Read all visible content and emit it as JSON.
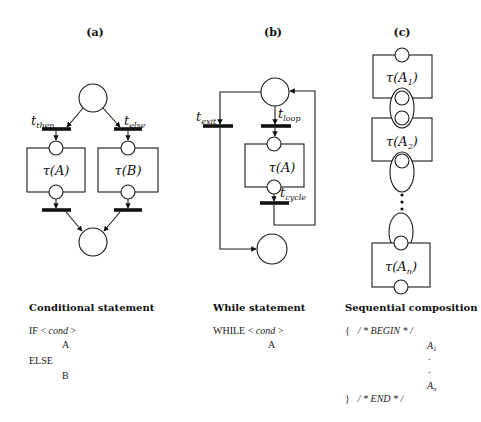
{
  "panels": {
    "a": {
      "label": "(a)",
      "transition_then": "then",
      "transition_else": "else",
      "box_a": "A",
      "box_b": "B",
      "title": "Conditional statement",
      "code": {
        "if_kw": "IF",
        "cond": "cond",
        "body_then": "A",
        "else_kw": "ELSE",
        "body_else": "B"
      }
    },
    "b": {
      "label": "(b)",
      "transition_exit": "exit",
      "transition_loop": "loop",
      "transition_cycle": "cycle",
      "box": "A",
      "title": "While statement",
      "code": {
        "while_kw": "WHILE",
        "cond": "cond",
        "body": "A"
      }
    },
    "c": {
      "label": "(c)",
      "box_1": "1",
      "box_2": "2",
      "box_n": "n",
      "title": "Sequential composition",
      "code": {
        "open": "{",
        "begin_comment": "/ * BEGIN * /",
        "item_first": "A",
        "item_first_sub": "1",
        "dot": ".",
        "item_last": "A",
        "item_last_sub": "n",
        "close": "}",
        "end_comment": "/ * END * /"
      }
    }
  },
  "symbols": {
    "t": "t",
    "tau": "τ",
    "lt": "<",
    "gt": ">"
  }
}
